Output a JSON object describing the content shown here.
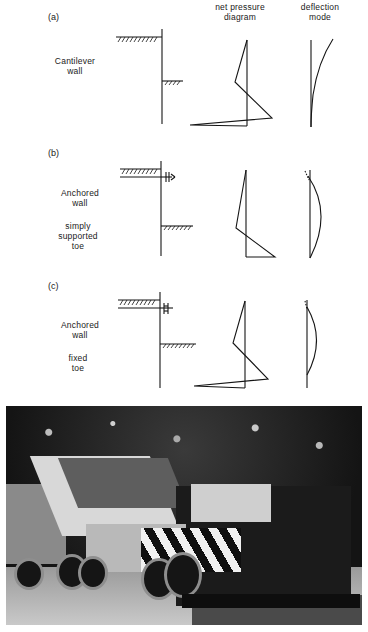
{
  "headers": {
    "net_pressure_line1": "net  pressure",
    "net_pressure_line2": "diagram",
    "deflection_line1": "deflection",
    "deflection_line2": "mode"
  },
  "panels": [
    {
      "tag": "(a)",
      "label_lines": [
        "Cantilever",
        "wall"
      ],
      "support_lines": []
    },
    {
      "tag": "(b)",
      "label_lines": [
        "Anchored",
        "wall"
      ],
      "support_lines": [
        "simply",
        "supported",
        "toe"
      ]
    },
    {
      "tag": "(c)",
      "label_lines": [
        "Anchored",
        "wall"
      ],
      "support_lines": [
        "fixed",
        "toe"
      ]
    }
  ],
  "photo": {
    "subject": "asphalt-paver-and-tipper-truck",
    "tone": "black-and-white"
  },
  "colors": {
    "ink": "#151515",
    "background": "#ffffff"
  }
}
